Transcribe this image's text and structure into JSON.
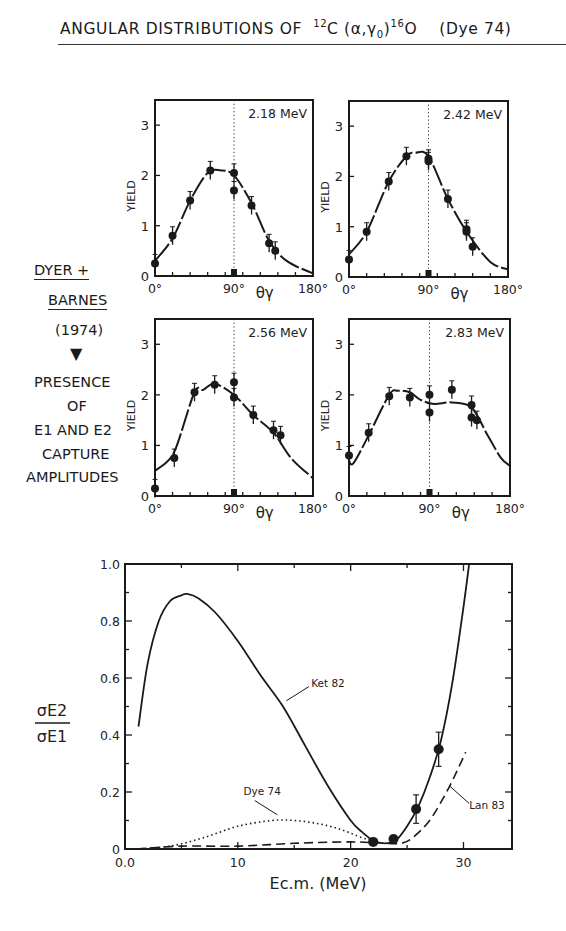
{
  "figure": {
    "title_prefix": "ANGULAR DISTRIBUTIONS OF",
    "title_reaction_target_mass": "12",
    "title_reaction_target": "C",
    "title_reaction_channel": "(α,γ",
    "title_reaction_channel_sub": "0",
    "title_reaction_channel_close": ")",
    "title_product_mass": "16",
    "title_product": "O",
    "title_ref": "(Dye 74)"
  },
  "side_note": {
    "line1": "DYER +",
    "line2": "BARNES",
    "line3": "(1974)",
    "arrow": "▼",
    "line4": "PRESENCE",
    "line5": "OF",
    "line6": "E1 AND E2",
    "line7": "CAPTURE",
    "line8": "AMPLITUDES"
  },
  "chart_data": [
    {
      "type": "scatter",
      "title": "2.18 MeV",
      "xlabel": "θγ",
      "ylabel": "YIELD",
      "xlim": [
        0,
        180
      ],
      "ylim": [
        0,
        3.5
      ],
      "xticks": [
        "0°",
        "90°",
        "180°"
      ],
      "yticks": [
        "0",
        "1",
        "2",
        "3"
      ],
      "points": [
        [
          0,
          0.25
        ],
        [
          20,
          0.8
        ],
        [
          40,
          1.5
        ],
        [
          63,
          2.1
        ],
        [
          90,
          2.05
        ],
        [
          90,
          1.7
        ],
        [
          110,
          1.4
        ],
        [
          130,
          0.65
        ],
        [
          137,
          0.5
        ]
      ],
      "fit_curve": [
        [
          0,
          0.3
        ],
        [
          20,
          0.75
        ],
        [
          40,
          1.5
        ],
        [
          60,
          2.05
        ],
        [
          75,
          2.1
        ],
        [
          90,
          2.0
        ],
        [
          110,
          1.45
        ],
        [
          130,
          0.7
        ],
        [
          150,
          0.3
        ],
        [
          180,
          0.05
        ]
      ],
      "reference_line_x": 90
    },
    {
      "type": "scatter",
      "title": "2.42 MeV",
      "xlabel": "θγ",
      "ylabel": "YIELD",
      "xlim": [
        0,
        180
      ],
      "ylim": [
        0,
        3.5
      ],
      "xticks": [
        "0°",
        "90°",
        "180°"
      ],
      "yticks": [
        "0",
        "1",
        "2",
        "3"
      ],
      "points": [
        [
          0,
          0.35
        ],
        [
          20,
          0.9
        ],
        [
          45,
          1.9
        ],
        [
          65,
          2.4
        ],
        [
          90,
          2.35
        ],
        [
          90,
          2.3
        ],
        [
          112,
          1.55
        ],
        [
          133,
          0.95
        ],
        [
          133,
          0.9
        ],
        [
          140,
          0.6
        ]
      ],
      "fit_curve": [
        [
          0,
          0.45
        ],
        [
          20,
          0.9
        ],
        [
          45,
          1.9
        ],
        [
          65,
          2.4
        ],
        [
          75,
          2.47
        ],
        [
          90,
          2.4
        ],
        [
          112,
          1.55
        ],
        [
          135,
          0.85
        ],
        [
          160,
          0.3
        ],
        [
          180,
          0.15
        ]
      ],
      "reference_line_x": 90
    },
    {
      "type": "scatter",
      "title": "2.56 MeV",
      "xlabel": "θγ",
      "ylabel": "YIELD",
      "xlim": [
        0,
        180
      ],
      "ylim": [
        0,
        3.5
      ],
      "xticks": [
        "0°",
        "90°",
        "180°"
      ],
      "yticks": [
        "0",
        "1",
        "2",
        "3"
      ],
      "points": [
        [
          0,
          0.15
        ],
        [
          22,
          0.75
        ],
        [
          45,
          2.05
        ],
        [
          68,
          2.2
        ],
        [
          90,
          2.25
        ],
        [
          90,
          1.95
        ],
        [
          112,
          1.6
        ],
        [
          135,
          1.3
        ],
        [
          143,
          1.2
        ]
      ],
      "fit_curve": [
        [
          0,
          0.5
        ],
        [
          15,
          0.7
        ],
        [
          25,
          1.0
        ],
        [
          45,
          2.05
        ],
        [
          55,
          2.1
        ],
        [
          68,
          2.22
        ],
        [
          90,
          2.0
        ],
        [
          112,
          1.6
        ],
        [
          135,
          1.25
        ],
        [
          155,
          0.75
        ],
        [
          180,
          0.35
        ]
      ],
      "reference_line_x": 90
    },
    {
      "type": "scatter",
      "title": "2.83 MeV",
      "xlabel": "θγ",
      "ylabel": "YIELD",
      "xlim": [
        0,
        180
      ],
      "ylim": [
        0,
        3.5
      ],
      "xticks": [
        "0°",
        "90°",
        "180°"
      ],
      "yticks": [
        "0",
        "1",
        "2",
        "3"
      ],
      "points": [
        [
          0,
          0.8
        ],
        [
          22,
          1.25
        ],
        [
          45,
          1.97
        ],
        [
          68,
          1.95
        ],
        [
          90,
          2.0
        ],
        [
          90,
          1.65
        ],
        [
          115,
          2.1
        ],
        [
          137,
          1.8
        ],
        [
          137,
          1.55
        ],
        [
          143,
          1.5
        ]
      ],
      "fit_curve": [
        [
          0,
          0.7
        ],
        [
          5,
          0.65
        ],
        [
          22,
          1.2
        ],
        [
          45,
          2.0
        ],
        [
          55,
          2.08
        ],
        [
          68,
          2.05
        ],
        [
          80,
          1.9
        ],
        [
          95,
          1.82
        ],
        [
          115,
          1.85
        ],
        [
          137,
          1.75
        ],
        [
          155,
          1.2
        ],
        [
          170,
          0.75
        ],
        [
          180,
          0.6
        ]
      ],
      "reference_line_x": 90
    },
    {
      "type": "line",
      "title": "",
      "xlabel": "Ec.m. (MeV)",
      "ylabel": "σE2 / σE1",
      "xlim": [
        0,
        34.3
      ],
      "ylim": [
        0,
        1.0
      ],
      "xticks": [
        "0.0",
        "10",
        "20",
        "30"
      ],
      "yticks": [
        "0",
        "0.2",
        "0.4",
        "0.6",
        "0.8",
        "1.0"
      ],
      "series": [
        {
          "name": "Ket 82",
          "style": "solid",
          "x": [
            1.2,
            2,
            3,
            4,
            5,
            5.5,
            6.5,
            8,
            10,
            12,
            14,
            16,
            18,
            20,
            21,
            22,
            23,
            24,
            25,
            26,
            27,
            28,
            29,
            30,
            30.5
          ],
          "y": [
            0.43,
            0.65,
            0.8,
            0.87,
            0.89,
            0.895,
            0.88,
            0.83,
            0.73,
            0.61,
            0.5,
            0.36,
            0.22,
            0.1,
            0.06,
            0.03,
            0.02,
            0.03,
            0.08,
            0.15,
            0.25,
            0.38,
            0.58,
            0.85,
            1.0
          ]
        },
        {
          "name": "Dye 74",
          "style": "dotted",
          "x": [
            1,
            4,
            7,
            10,
            13,
            15,
            17,
            19,
            21,
            22
          ],
          "y": [
            0.0,
            0.01,
            0.04,
            0.08,
            0.1,
            0.1,
            0.09,
            0.07,
            0.04,
            0.03
          ]
        },
        {
          "name": "Lan 83",
          "style": "dashed",
          "x": [
            1,
            5,
            10,
            15,
            20,
            23,
            24.5,
            25.5,
            27,
            28.5,
            29.5,
            30.2
          ],
          "y": [
            0.0,
            0.01,
            0.01,
            0.02,
            0.025,
            0.02,
            0.02,
            0.04,
            0.1,
            0.2,
            0.28,
            0.34
          ]
        }
      ],
      "data_points": [
        {
          "x": 22.0,
          "y": 0.025,
          "err": 0.01
        },
        {
          "x": 23.8,
          "y": 0.035,
          "err": 0.01
        },
        {
          "x": 25.8,
          "y": 0.14,
          "err": 0.05
        },
        {
          "x": 27.8,
          "y": 0.35,
          "err": 0.06
        }
      ],
      "annotations": [
        {
          "text": "Ket 82",
          "x": 16.5,
          "y": 0.57
        },
        {
          "text": "Dye 74",
          "x": 10.5,
          "y": 0.19
        },
        {
          "text": "Lan 83",
          "x": 30.5,
          "y": 0.14
        }
      ]
    }
  ]
}
